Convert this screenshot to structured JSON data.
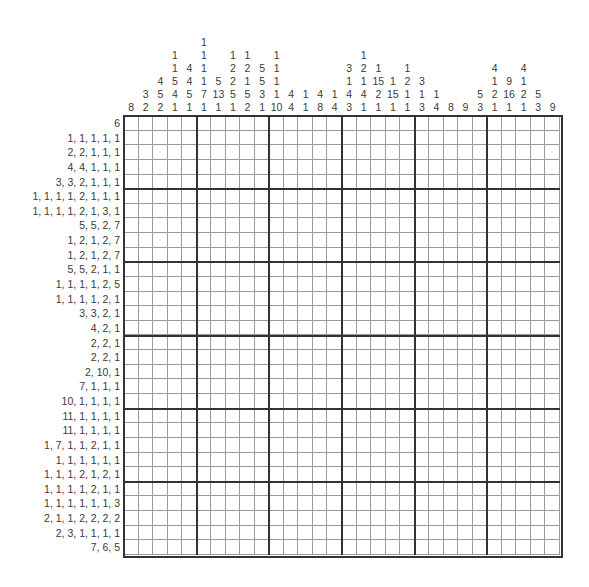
{
  "puzzle": {
    "type": "nonogram",
    "rows_count": 30,
    "cols_count": 30,
    "block_size": 5,
    "column_clues": [
      [
        8
      ],
      [
        3,
        2
      ],
      [
        4,
        5,
        2
      ],
      [
        1,
        1,
        5,
        4,
        1
      ],
      [
        4,
        4,
        5,
        1
      ],
      [
        1,
        1,
        1,
        1,
        7,
        1
      ],
      [
        5,
        13,
        1
      ],
      [
        1,
        2,
        2,
        5,
        1
      ],
      [
        1,
        2,
        1,
        5,
        2
      ],
      [
        5,
        5,
        3,
        1
      ],
      [
        1,
        1,
        1,
        1,
        10
      ],
      [
        4,
        4
      ],
      [
        1,
        1
      ],
      [
        4,
        8
      ],
      [
        1,
        4
      ],
      [
        3,
        1,
        4,
        3
      ],
      [
        1,
        2,
        1,
        4,
        1
      ],
      [
        1,
        15,
        2,
        1
      ],
      [
        1,
        15,
        1
      ],
      [
        1,
        2,
        1,
        1
      ],
      [
        3,
        1,
        3
      ],
      [
        1,
        4
      ],
      [
        8
      ],
      [
        9
      ],
      [
        5,
        3
      ],
      [
        4,
        1,
        2,
        1
      ],
      [
        9,
        16,
        1
      ],
      [
        4,
        1,
        2,
        1
      ],
      [
        5,
        3
      ],
      [
        9
      ]
    ],
    "row_clues": [
      "6",
      "1, 1, 1, 1, 1",
      "2, 2, 1, 1, 1",
      "4, 4, 1, 1, 1",
      "3, 3, 2, 1, 1, 1",
      "1, 1, 1, 1, 2, 1, 1, 1",
      "1, 1, 1, 1, 2, 1, 3, 1",
      "5, 5, 2, 7",
      "1, 2, 1, 2, 7",
      "1, 2, 1, 2, 7",
      "5, 5, 2, 1, 1",
      "1, 1, 1, 1, 2, 5",
      "1, 1, 1, 1, 2, 1",
      "3, 3, 2, 1",
      "4, 2, 1",
      "2, 2, 1",
      "2, 2, 1",
      "2, 10, 1",
      "7, 1, 1, 1",
      "10, 1, 1, 1, 1",
      "11, 1, 1, 1, 1",
      "11, 1, 1, 1, 1",
      "1, 7, 1, 1, 2, 1, 1",
      "1, 1, 1, 1, 1, 1",
      "1, 1, 1, 2, 1, 2, 1",
      "1, 1, 1, 1, 2, 1, 1",
      "1, 1, 1, 1, 1, 1, 3",
      "2, 1, 1, 2, 2, 2, 2",
      "2, 3, 1, 1, 1, 1",
      "7, 6, 5"
    ],
    "colors": {
      "clue_text": "#3a3a3a",
      "thin_line": "#9a9a9a",
      "thick_line": "#333333",
      "cell_bg": "#ffffff"
    }
  }
}
